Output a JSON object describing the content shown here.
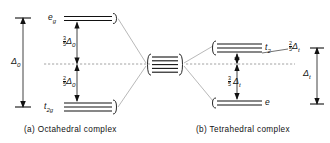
{
  "figure": {
    "type": "crystal-field-splitting-diagram",
    "captions": {
      "left": "(a)  Octahedral complex",
      "right": "(b)  Tetrahedral complex"
    }
  },
  "octahedral": {
    "upper_level": {
      "term": "e",
      "sub": "g",
      "degeneracy": 2,
      "label": "eg"
    },
    "lower_level": {
      "term": "t",
      "sub": "2g",
      "degeneracy": 3,
      "label": "t2g"
    },
    "free_ion_degeneracy": 5,
    "upper_split": {
      "numerator": "3",
      "denominator": "5",
      "symbol": "Δ",
      "sub": "0"
    },
    "lower_split": {
      "numerator": "2",
      "denominator": "5",
      "symbol": "Δ",
      "sub": "0"
    },
    "total_split": {
      "symbol": "Δ",
      "sub": "0"
    }
  },
  "tetrahedral": {
    "upper_level": {
      "term": "t",
      "sub": "2",
      "degeneracy": 3,
      "label": "t2"
    },
    "lower_level": {
      "term": "e",
      "sub": "",
      "degeneracy": 2,
      "label": "e"
    },
    "upper_split": {
      "numerator": "2",
      "denominator": "5",
      "symbol": "Δ",
      "sub": "t"
    },
    "lower_split": {
      "numerator": "3",
      "denominator": "5",
      "symbol": "Δ",
      "sub": "t"
    },
    "total_split": {
      "symbol": "Δ",
      "sub": "t"
    }
  },
  "colors": {
    "ink": "#111111",
    "baseline": "#8c8c8c",
    "correlation": "#8c8c8c",
    "background": "#ffffff"
  }
}
